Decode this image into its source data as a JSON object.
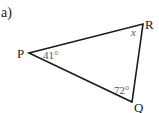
{
  "part_label": "a)",
  "triangle": {
    "vertices": [
      {
        "name": "P",
        "x": 29,
        "y": 53
      },
      {
        "name": "R",
        "x": 143,
        "y": 24
      },
      {
        "name": "Q",
        "x": 132,
        "y": 102
      }
    ],
    "angles": {
      "P": "41°",
      "R": "x",
      "Q": "72°"
    }
  },
  "colors": {
    "stroke": "#1a1a1a",
    "angle_text": "#555555",
    "background": "#ffffff"
  }
}
